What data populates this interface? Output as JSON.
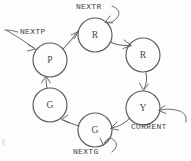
{
  "diagram": {
    "type": "state-ring-diagram",
    "style": "hand-drawn sketch, grey ink on white",
    "colors": {
      "background": "#fdfdfd",
      "ink": "#5a5a5a",
      "edge": "#6b6b6b",
      "label_text": "#3d3d3d"
    },
    "nodes": [
      {
        "id": "p",
        "label": "P",
        "cx": 50,
        "cy": 60,
        "r": 17
      },
      {
        "id": "r1",
        "label": "R",
        "cx": 95,
        "cy": 35,
        "r": 17
      },
      {
        "id": "r2",
        "label": "R",
        "cx": 143,
        "cy": 55,
        "r": 17
      },
      {
        "id": "y",
        "label": "Y",
        "cx": 143,
        "cy": 108,
        "r": 17
      },
      {
        "id": "g1",
        "label": "G",
        "cx": 95,
        "cy": 130,
        "r": 17
      },
      {
        "id": "g2",
        "label": "G",
        "cx": 50,
        "cy": 105,
        "r": 17
      }
    ],
    "edges": [
      {
        "from": "p",
        "to": "r1",
        "direction": "clockwise"
      },
      {
        "from": "r1",
        "to": "r2",
        "direction": "clockwise"
      },
      {
        "from": "r2",
        "to": "y",
        "direction": "clockwise"
      },
      {
        "from": "y",
        "to": "g1",
        "direction": "clockwise"
      },
      {
        "from": "g1",
        "to": "g2",
        "direction": "clockwise"
      },
      {
        "from": "g2",
        "to": "p",
        "direction": "clockwise"
      }
    ],
    "pointers": [
      {
        "id": "nextp",
        "label": "NEXTP",
        "target": "p",
        "kind": "external-arrow",
        "side": "left"
      },
      {
        "id": "nextr",
        "label": "NEXTR",
        "target": "r1",
        "kind": "self-loop",
        "side": "top"
      },
      {
        "id": "current",
        "label": "CURRENT",
        "target": "y",
        "kind": "external-arrow",
        "side": "right"
      },
      {
        "id": "nextg",
        "label": "NEXTG",
        "target": "g1",
        "kind": "self-loop",
        "side": "bottom"
      }
    ]
  }
}
